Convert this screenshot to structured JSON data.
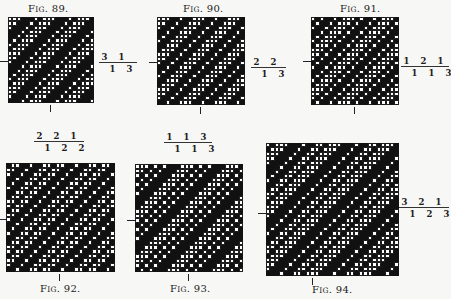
{
  "figures": [
    {
      "id": "fig89",
      "caption": "Fig. 89.",
      "caption_pos": "top",
      "formula": {
        "up": [
          3,
          1
        ],
        "down": [
          1,
          3
        ]
      },
      "grid": {
        "x": 8,
        "y": 17,
        "size": 86,
        "cells": 20
      },
      "caption_xy": [
        28,
        3
      ],
      "formula_xy": [
        99,
        62
      ],
      "formula_bar_w": 38,
      "tick_h_y": 61,
      "tick_v_x": 50
    },
    {
      "id": "fig90",
      "caption": "Fig. 90.",
      "caption_pos": "top",
      "formula": {
        "up": [
          2,
          2
        ],
        "down": [
          1,
          3
        ]
      },
      "grid": {
        "x": 157,
        "y": 17,
        "size": 88,
        "cells": 20
      },
      "caption_xy": [
        183,
        3
      ],
      "formula_xy": [
        251,
        67
      ],
      "formula_bar_w": 35,
      "tick_h_y": 62,
      "tick_v_x": 200
    },
    {
      "id": "fig91",
      "caption": "Fig. 91.",
      "caption_pos": "top",
      "formula": {
        "up": [
          1,
          2,
          1
        ],
        "down": [
          1,
          1,
          3
        ]
      },
      "grid": {
        "x": 311,
        "y": 17,
        "size": 88,
        "cells": 20
      },
      "caption_xy": [
        340,
        3
      ],
      "formula_xy": [
        401,
        66
      ],
      "formula_bar_w": 48,
      "tick_h_y": 61,
      "tick_v_x": 354
    },
    {
      "id": "fig92",
      "caption": "Fig. 92.",
      "caption_pos": "bottom",
      "formula": {
        "up": [
          2,
          2,
          1
        ],
        "down": [
          1,
          2,
          2
        ]
      },
      "grid": {
        "x": 6,
        "y": 163,
        "size": 109,
        "cells": 24
      },
      "caption_xy": [
        40,
        283
      ],
      "formula_xy": [
        34,
        141
      ],
      "formula_bar_w": 50,
      "tick_h_y": 219,
      "tick_v_x": 59
    },
    {
      "id": "fig93",
      "caption": "Fig. 93.",
      "caption_pos": "bottom",
      "formula": {
        "up": [
          1,
          1,
          3
        ],
        "down": [
          1,
          1,
          3
        ]
      },
      "grid": {
        "x": 135,
        "y": 164,
        "size": 108,
        "cells": 24
      },
      "caption_xy": [
        170,
        283
      ],
      "formula_xy": [
        164,
        142
      ],
      "formula_bar_w": 48,
      "tick_h_y": 220,
      "tick_v_x": 188
    },
    {
      "id": "fig94",
      "caption": "Fig. 94.",
      "caption_pos": "bottom",
      "formula": {
        "up": [
          3,
          2,
          1
        ],
        "down": [
          1,
          2,
          3
        ]
      },
      "grid": {
        "x": 266,
        "y": 143,
        "size": 133,
        "cells": 30
      },
      "caption_xy": [
        312,
        284
      ],
      "formula_xy": [
        399,
        207
      ],
      "formula_bar_w": 50,
      "tick_h_y": 213,
      "tick_v_x": 312
    }
  ]
}
